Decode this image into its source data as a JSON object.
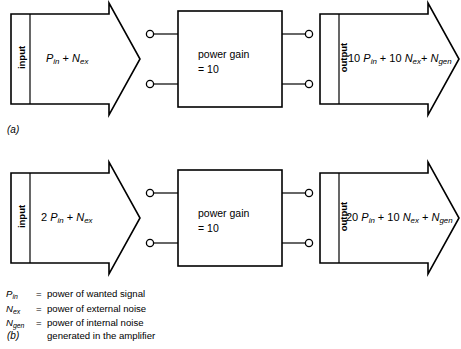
{
  "figure": {
    "title_hidden": "",
    "panels": [
      {
        "tag": "(a)",
        "input_block": {
          "side_label": "input",
          "expression": "P_in + N_ex",
          "expr_parts": [
            {
              "text": "P",
              "italic": true
            },
            {
              "text": "in",
              "sub": true
            },
            {
              "text": " + ",
              "italic": false
            },
            {
              "text": "N",
              "italic": true
            },
            {
              "text": "ex",
              "sub": true
            }
          ]
        },
        "amplifier": {
          "line1": "power gain",
          "line2": "= 10"
        },
        "output_block": {
          "side_label": "output",
          "expression": "10 P_in + 10 N_ex + N_gen",
          "expr_parts": [
            {
              "text": "10 ",
              "italic": false
            },
            {
              "text": "P",
              "italic": true
            },
            {
              "text": "in",
              "sub": true
            },
            {
              "text": " + 10 ",
              "italic": false
            },
            {
              "text": "N",
              "italic": true
            },
            {
              "text": "ex",
              "sub": true
            },
            {
              "text": " + ",
              "italic": false
            },
            {
              "text": "N",
              "italic": true
            },
            {
              "text": "gen",
              "sub": true
            }
          ]
        }
      },
      {
        "tag": "(b)",
        "input_block": {
          "side_label": "input",
          "expression": "2 P_in + N_ex",
          "expr_parts": [
            {
              "text": "2 ",
              "italic": false
            },
            {
              "text": "P",
              "italic": true
            },
            {
              "text": "in",
              "sub": true
            },
            {
              "text": " + ",
              "italic": false
            },
            {
              "text": "N",
              "italic": true
            },
            {
              "text": "ex",
              "sub": true
            }
          ]
        },
        "amplifier": {
          "line1": "power gain",
          "line2": "= 10"
        },
        "output_block": {
          "side_label": "output",
          "expression": "20 P_in + 10 N_ex + N_gen",
          "expr_parts": [
            {
              "text": "20 ",
              "italic": false
            },
            {
              "text": "P",
              "italic": true
            },
            {
              "text": "in",
              "sub": true
            },
            {
              "text": " + 10 ",
              "italic": false
            },
            {
              "text": "N",
              "italic": true
            },
            {
              "text": "ex",
              "sub": true
            },
            {
              "text": " + ",
              "italic": false
            },
            {
              "text": "N",
              "italic": true
            },
            {
              "text": "gen",
              "sub": true
            }
          ]
        }
      }
    ],
    "legend": [
      {
        "symbol_base": "P",
        "symbol_sub": "in",
        "equals": "=",
        "definition": "power of wanted signal"
      },
      {
        "symbol_base": "N",
        "symbol_sub": "ex",
        "equals": "=",
        "definition": "power of external noise"
      },
      {
        "symbol_base": "N",
        "symbol_sub": "gen",
        "equals": "=",
        "definition": "power of internal noise\ngenerated in the amplifier"
      }
    ]
  },
  "colors": {
    "ink": "#000000",
    "paper": "#ffffff"
  }
}
